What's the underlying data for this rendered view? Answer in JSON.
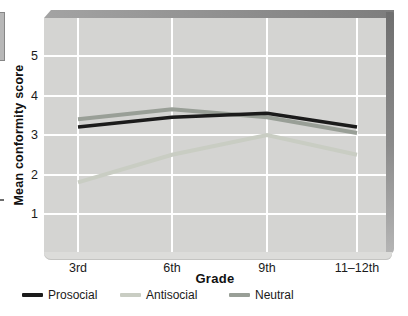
{
  "chart_data": {
    "type": "line",
    "categories": [
      "3rd",
      "6th",
      "9th",
      "11–12th"
    ],
    "series": [
      {
        "name": "Prosocial",
        "color": "#1b1b1b",
        "values": [
          3.2,
          3.45,
          3.55,
          3.2
        ]
      },
      {
        "name": "Antisocial",
        "color": "#c9cdc3",
        "values": [
          1.8,
          2.5,
          3.0,
          2.5
        ]
      },
      {
        "name": "Neutral",
        "color": "#999f97",
        "values": [
          3.4,
          3.65,
          3.45,
          3.05
        ]
      }
    ],
    "title": "",
    "xlabel": "Grade",
    "ylabel": "Mean conformity score",
    "yticks": [
      1,
      2,
      3,
      4,
      5
    ],
    "ylim": [
      0,
      6
    ],
    "grid": true,
    "gridline_color": "#ffffff",
    "plot_bg": "#d4d4d2",
    "legend_position": "bottom-left"
  }
}
